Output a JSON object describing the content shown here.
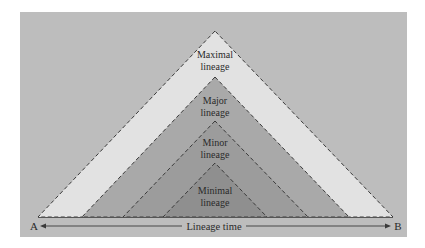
{
  "diagram": {
    "colors": {
      "background_panel": "#bdbdbd",
      "maximal": "#e2e2e2",
      "major": "#a9a9a9",
      "minor": "#9c9c9c",
      "minimal": "#8f8f8f",
      "outline": "#3a3a3a",
      "text": "#2a2a2a"
    },
    "triangles": [
      {
        "id": "maximal",
        "line1": "Maximal",
        "line2": "lineage"
      },
      {
        "id": "major",
        "line1": "Major",
        "line2": "lineage"
      },
      {
        "id": "minor",
        "line1": "Minor",
        "line2": "lineage"
      },
      {
        "id": "minimal",
        "line1": "Minimal",
        "line2": "lineage"
      }
    ],
    "axis": {
      "start_label": "A",
      "end_label": "B",
      "label": "Lineage time"
    }
  }
}
